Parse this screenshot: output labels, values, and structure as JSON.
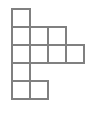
{
  "figure": {
    "type": "unit-square-grid-shape",
    "canvas": {
      "width": 93,
      "height": 116,
      "background_color": "#ffffff"
    },
    "grid": {
      "origin_x": 12,
      "origin_y": 9,
      "cell_size": 18,
      "rows": 5,
      "columns": 4,
      "line_color": "#808080",
      "line_width": 1.4,
      "fill_color": "#ffffff"
    },
    "cells": [
      {
        "row": 1,
        "col": 1
      },
      {
        "row": 2,
        "col": 1
      },
      {
        "row": 2,
        "col": 2
      },
      {
        "row": 2,
        "col": 3
      },
      {
        "row": 3,
        "col": 1
      },
      {
        "row": 3,
        "col": 2
      },
      {
        "row": 3,
        "col": 3
      },
      {
        "row": 3,
        "col": 4
      },
      {
        "row": 4,
        "col": 1
      },
      {
        "row": 5,
        "col": 1
      },
      {
        "row": 5,
        "col": 2
      }
    ],
    "row_occupancy": [
      {
        "row": 1,
        "columns": [
          1
        ],
        "count": 1
      },
      {
        "row": 2,
        "columns": [
          1,
          2,
          3
        ],
        "count": 3
      },
      {
        "row": 3,
        "columns": [
          1,
          2,
          3,
          4
        ],
        "count": 4
      },
      {
        "row": 4,
        "columns": [
          1
        ],
        "count": 1
      },
      {
        "row": 5,
        "columns": [
          1,
          2
        ],
        "count": 2
      }
    ],
    "total_cells": 11
  }
}
